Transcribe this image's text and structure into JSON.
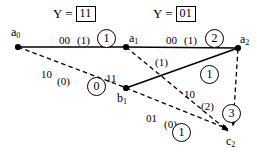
{
  "diagram": {
    "headers": [
      {
        "name": "y-header-left",
        "prefix": "Y =",
        "value": "11",
        "x": 53,
        "y": 6
      },
      {
        "name": "y-header-right",
        "prefix": "Y =",
        "value": "01",
        "x": 153,
        "y": 6
      }
    ],
    "nodes": [
      {
        "id": "a0",
        "label": "a",
        "sub": "0",
        "cx": 18,
        "cy": 47,
        "lx": 11,
        "ly": 26
      },
      {
        "id": "a1",
        "label": "a",
        "sub": "1",
        "cx": 126,
        "cy": 47,
        "lx": 129,
        "ly": 32
      },
      {
        "id": "a2",
        "label": "a",
        "sub": "2",
        "cx": 238,
        "cy": 48,
        "lx": 240,
        "ly": 33
      },
      {
        "id": "b1",
        "label": "b",
        "sub": "1",
        "cx": 126,
        "cy": 88,
        "lx": 117,
        "ly": 92
      },
      {
        "id": "c2",
        "label": "c",
        "sub": "2",
        "cx": 231,
        "cy": 134,
        "lx": 226,
        "ly": 135
      }
    ],
    "branch_labels": [
      {
        "name": "branch-label-a0-a1-input",
        "text": "00",
        "x": 59,
        "y": 35
      },
      {
        "name": "branch-label-a0-a1-metric",
        "text": "(1)",
        "x": 77,
        "y": 35
      },
      {
        "name": "branch-label-a1-a2-input",
        "text": "00",
        "x": 166,
        "y": 35
      },
      {
        "name": "branch-label-a1-a2-metric",
        "text": "(1)",
        "x": 184,
        "y": 35
      },
      {
        "name": "branch-label-a0-b1-input",
        "text": "10",
        "x": 41,
        "y": 69
      },
      {
        "name": "branch-label-a0-b1-metric",
        "text": "(0)",
        "x": 57,
        "y": 76
      },
      {
        "name": "branch-label-b1-a2-input",
        "text": "11",
        "x": 106,
        "y": 73
      },
      {
        "name": "branch-label-b1-a2-metric",
        "text": "(1)",
        "x": 155,
        "y": 57
      },
      {
        "name": "branch-label-a1-c2-input",
        "text": "10",
        "x": 184,
        "y": 89
      },
      {
        "name": "branch-label-a1-c2-metric",
        "text": "(2)",
        "x": 201,
        "y": 101
      },
      {
        "name": "branch-label-b1-c2-input",
        "text": "01",
        "x": 146,
        "y": 113
      },
      {
        "name": "branch-label-b1-c2-metric",
        "text": "(0)",
        "x": 164,
        "y": 119
      }
    ],
    "metrics": [
      {
        "name": "path-metric-a1",
        "value": "1",
        "x": 97,
        "y": 29
      },
      {
        "name": "path-metric-a2-top",
        "value": "2",
        "x": 205,
        "y": 29
      },
      {
        "name": "path-metric-b1",
        "value": "0",
        "x": 87,
        "y": 77
      },
      {
        "name": "path-metric-a2-bottom",
        "value": "1",
        "x": 200,
        "y": 65
      },
      {
        "name": "path-metric-c2-top",
        "value": "3",
        "x": 222,
        "y": 104
      },
      {
        "name": "path-metric-c2-bottom",
        "value": "1",
        "x": 172,
        "y": 123
      }
    ],
    "edges": [
      {
        "name": "edge-a0-a1",
        "style": "solid",
        "x1": 18,
        "y1": 47,
        "x2": 126,
        "y2": 47
      },
      {
        "name": "edge-a1-a2",
        "style": "solid",
        "x1": 126,
        "y1": 47,
        "x2": 238,
        "y2": 48
      },
      {
        "name": "edge-b1-a2",
        "style": "solid",
        "x1": 126,
        "y1": 88,
        "x2": 238,
        "y2": 48
      },
      {
        "name": "edge-a0-b1",
        "style": "dashed",
        "x1": 18,
        "y1": 47,
        "x2": 126,
        "y2": 88
      },
      {
        "name": "edge-a1-c2",
        "style": "dashed",
        "x1": 126,
        "y1": 47,
        "x2": 229,
        "y2": 132
      },
      {
        "name": "edge-b1-c2",
        "style": "dashed",
        "x1": 126,
        "y1": 88,
        "x2": 229,
        "y2": 130
      },
      {
        "name": "edge-a2-c2",
        "style": "dashed",
        "x1": 238,
        "y1": 48,
        "x2": 232,
        "y2": 128
      }
    ],
    "colors": {
      "ink": "#000000",
      "background": "#ffffff"
    }
  }
}
